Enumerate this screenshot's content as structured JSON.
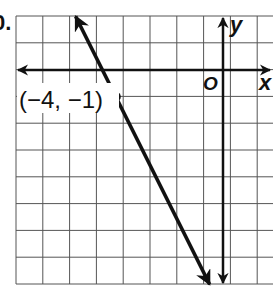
{
  "problem": {
    "number_label": "0."
  },
  "graph": {
    "grid": {
      "columns": 10,
      "rows": 10,
      "cell_px": 26.8,
      "left_px": 16,
      "top_px": 16,
      "line_color": "#555555"
    },
    "axes": {
      "origin_label": "O",
      "x_label": "x",
      "y_label": "y",
      "origin_px": [
        223,
        70
      ],
      "x_range": [
        -8,
        1.8
      ],
      "y_range": [
        -8,
        2
      ]
    },
    "line": {
      "equation": "y = -2x - 9",
      "slope": -2,
      "y_intercept": -9,
      "from": [
        -5.5,
        2
      ],
      "to": [
        -0.5,
        -8
      ],
      "color": "#111111"
    },
    "point": {
      "x": -4,
      "y": -1,
      "label": "(−4, −1)"
    }
  },
  "chart_data": {
    "type": "line",
    "title": "",
    "xlabel": "x",
    "ylabel": "y",
    "xlim": [
      -8,
      1.8
    ],
    "ylim": [
      -8,
      2
    ],
    "grid": true,
    "series": [
      {
        "name": "y = -2x - 9",
        "x": [
          -5.5,
          -4,
          -0.5
        ],
        "y": [
          2,
          -1,
          -8
        ]
      }
    ],
    "annotations": [
      {
        "text": "(−4, −1)",
        "x": -4,
        "y": -1
      },
      {
        "text": "O",
        "x": 0,
        "y": 0
      }
    ]
  }
}
